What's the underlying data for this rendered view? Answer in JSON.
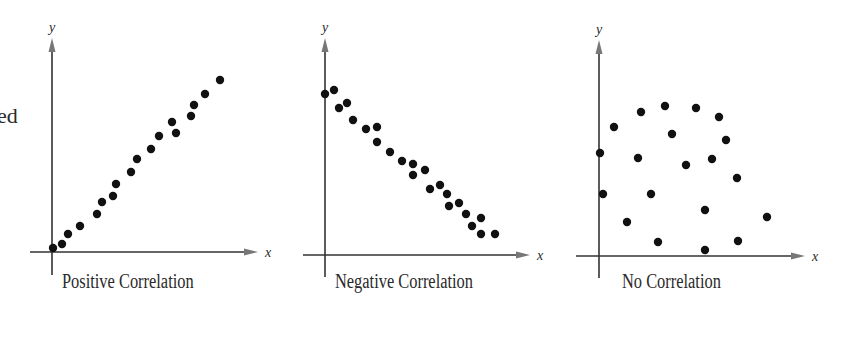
{
  "fragment_text": "ed",
  "chart_data": [
    {
      "type": "scatter",
      "title": "Positive Correlation",
      "xlabel": "x",
      "ylabel": "y",
      "grid": false,
      "points": [
        [
          53,
          248
        ],
        [
          62,
          244
        ],
        [
          68,
          234
        ],
        [
          80,
          226
        ],
        [
          97,
          214
        ],
        [
          102,
          202
        ],
        [
          113,
          196
        ],
        [
          116,
          184
        ],
        [
          131,
          172
        ],
        [
          137,
          159
        ],
        [
          151,
          149
        ],
        [
          159,
          136
        ],
        [
          172,
          122
        ],
        [
          176,
          133
        ],
        [
          191,
          116
        ],
        [
          194,
          105
        ],
        [
          205,
          94
        ],
        [
          220,
          80
        ]
      ],
      "axes": {
        "origin": [
          52,
          252
        ],
        "x_end": 258,
        "x_start": 30,
        "y_end": 38,
        "y_start": 275
      }
    },
    {
      "type": "scatter",
      "title": "Negative Correlation",
      "xlabel": "x",
      "ylabel": "y",
      "grid": false,
      "points": [
        [
          325,
          94
        ],
        [
          334,
          90
        ],
        [
          339,
          108
        ],
        [
          347,
          103
        ],
        [
          353,
          120
        ],
        [
          366,
          129
        ],
        [
          377,
          127
        ],
        [
          377,
          142
        ],
        [
          390,
          152
        ],
        [
          402,
          161
        ],
        [
          413,
          164
        ],
        [
          413,
          175
        ],
        [
          425,
          170
        ],
        [
          430,
          189
        ],
        [
          440,
          185
        ],
        [
          447,
          194
        ],
        [
          449,
          206
        ],
        [
          459,
          203
        ],
        [
          466,
          214
        ],
        [
          472,
          226
        ],
        [
          481,
          218
        ],
        [
          481,
          234
        ],
        [
          495,
          234
        ]
      ],
      "axes": {
        "origin": [
          325,
          255
        ],
        "x_end": 530,
        "x_start": 303,
        "y_end": 38,
        "y_start": 277
      }
    },
    {
      "type": "scatter",
      "title": "No Correlation",
      "xlabel": "x",
      "ylabel": "y",
      "grid": false,
      "points": [
        [
          600,
          153
        ],
        [
          603,
          194
        ],
        [
          614,
          127
        ],
        [
          627,
          222
        ],
        [
          638,
          158
        ],
        [
          641,
          112
        ],
        [
          651,
          194
        ],
        [
          658,
          242
        ],
        [
          665,
          106
        ],
        [
          672,
          134
        ],
        [
          686,
          165
        ],
        [
          696,
          108
        ],
        [
          705,
          210
        ],
        [
          705,
          250
        ],
        [
          712,
          159
        ],
        [
          719,
          117
        ],
        [
          726,
          140
        ],
        [
          737,
          178
        ],
        [
          738,
          241
        ],
        [
          767,
          217
        ]
      ],
      "axes": {
        "origin": [
          599,
          256
        ],
        "x_end": 805,
        "x_start": 576,
        "y_end": 40,
        "y_start": 278
      }
    }
  ],
  "colors": {
    "axis": "#333333",
    "arrow": "#777777",
    "dot": "#111111",
    "text": "#2a2a2a"
  }
}
